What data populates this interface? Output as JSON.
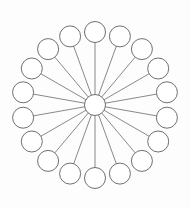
{
  "diagram": {
    "title": "Radial star graph",
    "type": "star-graph",
    "background_color": "#fdfdfd",
    "stroke_color": "#5f5f5f",
    "edge_color": "#6b6b6b",
    "node_fill": "#ffffff",
    "canvas": {
      "width": 191,
      "height": 208
    },
    "hub": {
      "label": "center-hub",
      "cx": 95,
      "cy": 105,
      "r": 10.5
    },
    "leaf_count": 18,
    "leaf_radius": 10.5,
    "ring_radius": 73,
    "angle_step_degrees": 20,
    "start_angle_degrees": 90,
    "leaves": [
      {
        "label": "node-1",
        "angle": 90,
        "cx": 95.0,
        "cy": 32.0
      },
      {
        "label": "node-2",
        "angle": 70,
        "cx": 119.9,
        "cy": 36.4
      },
      {
        "label": "node-3",
        "angle": 50,
        "cx": 141.9,
        "cy": 49.1
      },
      {
        "label": "node-4",
        "angle": 30,
        "cx": 158.2,
        "cy": 68.5
      },
      {
        "label": "node-5",
        "angle": 10,
        "cx": 166.9,
        "cy": 92.3
      },
      {
        "label": "node-6",
        "angle": -10,
        "cx": 166.9,
        "cy": 117.7
      },
      {
        "label": "node-7",
        "angle": -30,
        "cx": 158.2,
        "cy": 141.5
      },
      {
        "label": "node-8",
        "angle": -50,
        "cx": 141.9,
        "cy": 160.9
      },
      {
        "label": "node-9",
        "angle": -70,
        "cx": 119.9,
        "cy": 173.6
      },
      {
        "label": "node-10",
        "angle": -90,
        "cx": 95.0,
        "cy": 178.0
      },
      {
        "label": "node-11",
        "angle": 250,
        "cx": 70.1,
        "cy": 173.6
      },
      {
        "label": "node-12",
        "angle": 230,
        "cx": 48.1,
        "cy": 160.9
      },
      {
        "label": "node-13",
        "angle": 210,
        "cx": 31.8,
        "cy": 141.5
      },
      {
        "label": "node-14",
        "angle": 190,
        "cx": 23.1,
        "cy": 117.7
      },
      {
        "label": "node-15",
        "angle": 170,
        "cx": 23.1,
        "cy": 92.3
      },
      {
        "label": "node-16",
        "angle": 150,
        "cx": 31.8,
        "cy": 68.5
      },
      {
        "label": "node-17",
        "angle": 130,
        "cx": 48.1,
        "cy": 49.1
      },
      {
        "label": "node-18",
        "angle": 110,
        "cx": 70.1,
        "cy": 36.4
      }
    ]
  }
}
